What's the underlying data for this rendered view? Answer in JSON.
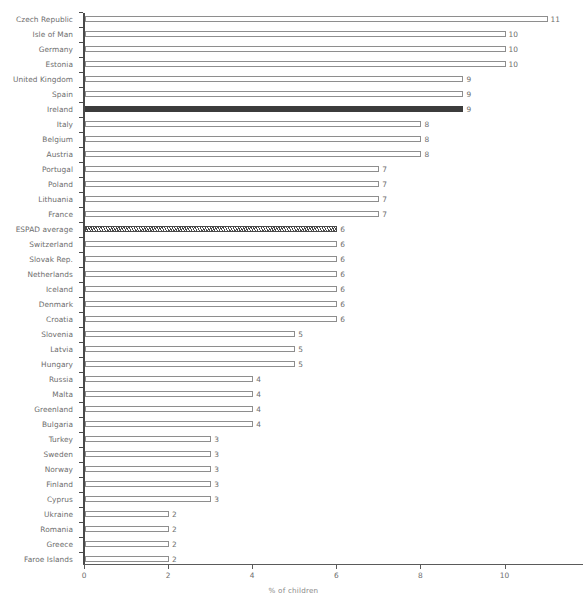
{
  "chart_data": {
    "type": "bar",
    "orientation": "horizontal",
    "title": "",
    "xlabel": "% of children",
    "ylabel": "",
    "xlim": [
      0,
      11.8
    ],
    "xticks": [
      0,
      2,
      4,
      6,
      8,
      10
    ],
    "xtick_labels": [
      "0",
      "2",
      "4",
      "6",
      "8",
      "10"
    ],
    "grid": false,
    "legend": null,
    "categories": [
      "Czech Republic",
      "Isle of Man",
      "Germany",
      "Estonia",
      "United Kingdom",
      "Spain",
      "Ireland",
      "Italy",
      "Belgium",
      "Austria",
      "Portugal",
      "Poland",
      "Lithuania",
      "France",
      "ESPAD average",
      "Switzerland",
      "Slovak Rep.",
      "Netherlands",
      "Iceland",
      "Denmark",
      "Croatia",
      "Slovenia",
      "Latvia",
      "Hungary",
      "Russia",
      "Malta",
      "Greenland",
      "Bulgaria",
      "Turkey",
      "Sweden",
      "Norway",
      "Finland",
      "Cyprus",
      "Ukraine",
      "Romania",
      "Greece",
      "Faroe Islands"
    ],
    "values": [
      11,
      10,
      10,
      10,
      9,
      9,
      9,
      8,
      8,
      8,
      7,
      7,
      7,
      7,
      6,
      6,
      6,
      6,
      6,
      6,
      6,
      5,
      5,
      5,
      4,
      4,
      4,
      4,
      3,
      3,
      3,
      3,
      3,
      2,
      2,
      2,
      2
    ],
    "value_labels": [
      "11",
      "10",
      "10",
      "10",
      "9",
      "9",
      "9",
      "8",
      "8",
      "8",
      "7",
      "7",
      "7",
      "7",
      "6",
      "6",
      "6",
      "6",
      "6",
      "6",
      "6",
      "5",
      "5",
      "5",
      "4",
      "4",
      "4",
      "4",
      "3",
      "3",
      "3",
      "3",
      "3",
      "2",
      "2",
      "2",
      "2"
    ],
    "bar_styles": [
      "plain",
      "plain",
      "plain",
      "plain",
      "plain",
      "plain",
      "highlight",
      "plain",
      "plain",
      "plain",
      "plain",
      "plain",
      "plain",
      "plain",
      "hatched",
      "plain",
      "plain",
      "plain",
      "plain",
      "plain",
      "plain",
      "plain",
      "plain",
      "plain",
      "plain",
      "plain",
      "plain",
      "plain",
      "plain",
      "plain",
      "plain",
      "plain",
      "plain",
      "plain",
      "plain",
      "plain",
      "plain"
    ],
    "colors": {
      "bar_fill": "#ffffff",
      "bar_edge": "#8e8e8e",
      "highlight_fill": "#3c3c3c",
      "hatch_edge": "#4a4a4a",
      "label_text": "#6d6d6d",
      "axis_line": "#4a4a4a",
      "background": "#ffffff"
    }
  }
}
